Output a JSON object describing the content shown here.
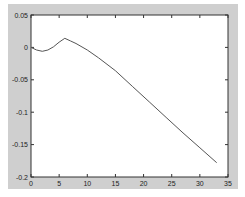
{
  "colors": {
    "figure_bg": "#cfcfcf",
    "axes_bg": "#ffffff",
    "axes_line": "#333333",
    "series_line": "#555555"
  },
  "chart_data": {
    "type": "line",
    "title": "",
    "xlabel": "",
    "ylabel": "",
    "xlim": [
      0,
      35
    ],
    "ylim": [
      -0.2,
      0.05
    ],
    "grid": false,
    "legend": null,
    "xticks": [
      0,
      5,
      10,
      15,
      20,
      25,
      30,
      35
    ],
    "xtick_labels": [
      "0",
      "5",
      "10",
      "15",
      "20",
      "25",
      "30",
      "35"
    ],
    "yticks": [
      0.05,
      0,
      -0.05,
      -0.1,
      -0.15,
      -0.2
    ],
    "ytick_labels": [
      "0.05",
      "0",
      "-0.05",
      "-0.1",
      "-0.15",
      "-0.2"
    ],
    "series": [
      {
        "name": "series1",
        "x": [
          0,
          1,
          2,
          3,
          4,
          5,
          6,
          7,
          8,
          10,
          12,
          15,
          18,
          21,
          24,
          27,
          30,
          33
        ],
        "y": [
          0,
          -0.004,
          -0.006,
          -0.004,
          0.001,
          0.008,
          0.014,
          0.01,
          0.006,
          -0.004,
          -0.016,
          -0.036,
          -0.06,
          -0.084,
          -0.108,
          -0.132,
          -0.155,
          -0.178
        ]
      }
    ]
  }
}
